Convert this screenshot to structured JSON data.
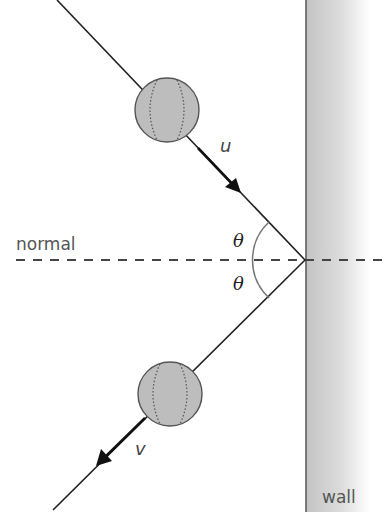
{
  "diagram": {
    "labels": {
      "normal": "normal",
      "wall": "wall",
      "incoming_velocity": "u",
      "outgoing_velocity": "v",
      "angle_incident": "θ",
      "angle_reflected": "θ"
    },
    "colors": {
      "line": "#222222",
      "ball_fill": "#bdbdbd",
      "ball_stroke": "#555555",
      "wall_dark": "#c4c4c4",
      "wall_light": "#ffffff",
      "wall_edge": "#555555",
      "arc": "#777777"
    },
    "geometry": {
      "impact_point": [
        305,
        260
      ],
      "incoming_start": [
        57,
        0
      ],
      "outgoing_end": [
        53,
        510
      ],
      "ball_incoming_center": [
        167,
        110
      ],
      "ball_outgoing_center": [
        170,
        394
      ],
      "ball_radius": 32,
      "wall_left_x": 306,
      "normal_y": 260
    }
  }
}
